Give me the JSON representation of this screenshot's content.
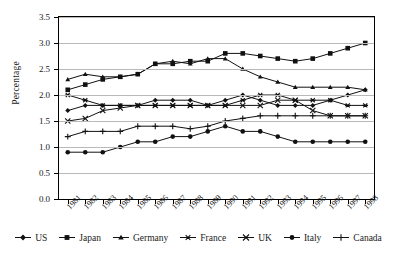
{
  "chart_data": {
    "type": "line",
    "title": "",
    "xlabel": "",
    "ylabel": "Percentage",
    "categories": [
      "1981",
      "1982",
      "1983",
      "1984",
      "1985",
      "1986",
      "1987",
      "1988",
      "1989",
      "1990",
      "1991",
      "1992",
      "1993",
      "1994",
      "1995",
      "1996",
      "1997",
      "1998"
    ],
    "ylim": [
      0.0,
      3.5
    ],
    "ytick_labels": [
      "0.0",
      "0.5",
      "1.0",
      "1.5",
      "2.0",
      "2.5",
      "3.0",
      "3.5"
    ],
    "ytick_values": [
      0.0,
      0.5,
      1.0,
      1.5,
      2.0,
      2.5,
      3.0,
      3.5
    ],
    "grid": true,
    "legend_position": "bottom",
    "series": [
      {
        "name": "US",
        "marker": "diamond",
        "values": [
          1.7,
          1.8,
          1.8,
          1.8,
          1.8,
          1.9,
          1.9,
          1.9,
          1.8,
          1.9,
          2.0,
          1.9,
          1.8,
          1.8,
          1.8,
          1.9,
          2.0,
          2.1
        ]
      },
      {
        "name": "Japan",
        "marker": "square",
        "values": [
          2.1,
          2.2,
          2.3,
          2.35,
          2.4,
          2.6,
          2.6,
          2.65,
          2.65,
          2.8,
          2.8,
          2.75,
          2.7,
          2.65,
          2.7,
          2.8,
          2.9,
          3.0
        ]
      },
      {
        "name": "Germany",
        "marker": "triangle",
        "values": [
          2.3,
          2.4,
          2.35,
          2.35,
          2.4,
          2.6,
          2.65,
          2.6,
          2.7,
          2.7,
          2.5,
          2.35,
          2.25,
          2.15,
          2.15,
          2.15,
          2.15,
          2.1
        ]
      },
      {
        "name": "France",
        "marker": "asterisk",
        "values": [
          2.0,
          1.9,
          1.8,
          1.8,
          1.8,
          1.8,
          1.8,
          1.8,
          1.8,
          1.8,
          1.9,
          2.0,
          2.0,
          1.9,
          1.9,
          1.9,
          1.8,
          1.8
        ]
      },
      {
        "name": "UK",
        "marker": "cross",
        "values": [
          1.5,
          1.55,
          1.7,
          1.75,
          1.8,
          1.8,
          1.8,
          1.8,
          1.8,
          1.8,
          1.8,
          1.8,
          1.9,
          1.9,
          1.7,
          1.6,
          1.6,
          1.6
        ]
      },
      {
        "name": "Italy",
        "marker": "circle",
        "values": [
          0.9,
          0.9,
          0.9,
          1.0,
          1.1,
          1.1,
          1.2,
          1.2,
          1.3,
          1.4,
          1.3,
          1.3,
          1.2,
          1.1,
          1.1,
          1.1,
          1.1,
          1.1
        ]
      },
      {
        "name": "Canada",
        "marker": "plus",
        "values": [
          1.2,
          1.3,
          1.3,
          1.3,
          1.4,
          1.4,
          1.4,
          1.35,
          1.4,
          1.5,
          1.55,
          1.6,
          1.6,
          1.6,
          1.6,
          1.6,
          1.6,
          1.6
        ]
      }
    ]
  }
}
